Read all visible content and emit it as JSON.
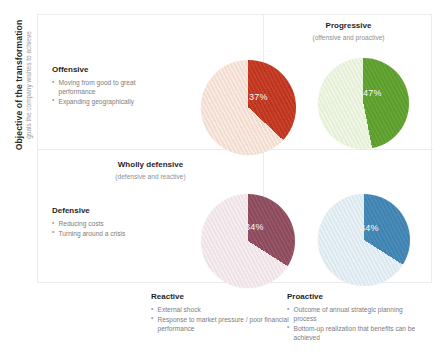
{
  "axes": {
    "y_title": "Objective of the transformation",
    "y_subtitle": "goals the company wishes to achieve"
  },
  "quadrants": {
    "offensive": {
      "title": "Offensive",
      "bullets": [
        "Moving from good to great performance",
        "Expanding geographically"
      ]
    },
    "defensive": {
      "title": "Defensive",
      "bullets": [
        "Reducing costs",
        "Turning around a crisis"
      ]
    },
    "progressive": {
      "title": "Progressive",
      "subtitle": "(offensive and proactive)"
    },
    "wholly_defensive": {
      "title": "Wholly defensive",
      "subtitle": "(defensive and reactive)"
    },
    "reactive": {
      "title": "Reactive",
      "bullets": [
        "External shock",
        "Response to market pressure / poor financial performance"
      ]
    },
    "proactive": {
      "title": "Proactive",
      "bullets": [
        "Outcome of annual strategic planning process",
        "Bottom-up realization that benefits can be achieved"
      ]
    }
  },
  "chart_data": {
    "type": "pie",
    "title": "",
    "note": "Four single-slice share pies, one per quadrant of a 2x2 transformation matrix. Each highlighted slice starts at 12 o'clock and sweeps clockwise; remainder is a light hatched fill of the same hue.",
    "charts": [
      {
        "id": "offensive-reactive",
        "quadrant": "top-left",
        "label": "37%",
        "value": 37,
        "remainder": 63,
        "color": "#C0341D",
        "light_color": "#F2DCCF"
      },
      {
        "id": "progressive",
        "quadrant": "top-right",
        "label": "47%",
        "value": 47,
        "remainder": 53,
        "color": "#5C9E2B",
        "light_color": "#E4EFD6"
      },
      {
        "id": "wholly-defensive",
        "quadrant": "bottom-left",
        "label": "34%",
        "value": 34,
        "remainder": 66,
        "color": "#8C4A5C",
        "light_color": "#EEE2E6"
      },
      {
        "id": "defensive-proactive",
        "quadrant": "bottom-right",
        "label": "34%",
        "value": 34,
        "remainder": 66,
        "color": "#3F83B3",
        "light_color": "#DCE8F0"
      }
    ]
  },
  "colors": {
    "red": "#C0341D",
    "green": "#5C9E2B",
    "maroon": "#8C4A5C",
    "blue": "#3F83B3",
    "grid": "#ECECEC",
    "text_dark": "#1F1F1F",
    "text_muted": "#8F8F8F"
  }
}
